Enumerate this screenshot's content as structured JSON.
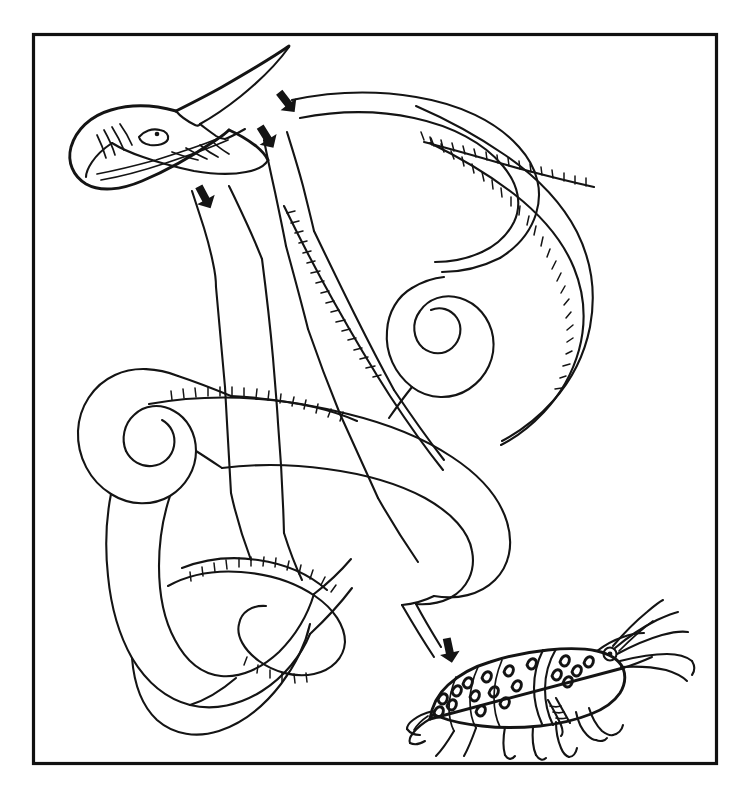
{
  "figure": {
    "title": "Squid capturing shrimp prey",
    "background_color": "#ffffff",
    "ink_color": "#141414",
    "frame_color": "#111111",
    "style": "black-and-white pen-and-ink line drawing",
    "frame": {
      "x": 32,
      "y": 33,
      "width": 686,
      "height": 732,
      "stroke_width": 3
    }
  },
  "subjects": {
    "squid": {
      "name": "squid",
      "parts": [
        "mantle-fin",
        "head",
        "eye",
        "gill-lines",
        "funnel",
        "arms",
        "feeding-tentacles",
        "sucker-rows"
      ],
      "position": "upper-left",
      "eye_center": [
        148,
        133
      ]
    },
    "shrimp": {
      "name": "shrimp",
      "parts": [
        "carapace",
        "abdomen-segments",
        "rostrum",
        "antennae",
        "eye",
        "walking-legs",
        "chelipeds",
        "tail-fan",
        "speckled-markings"
      ],
      "position": "lower-right",
      "eye_center": [
        610,
        654
      ]
    }
  },
  "annotations": {
    "arrow_count": 4,
    "arrow_direction": "down-right",
    "arrows": [
      {
        "id": "arrow-1",
        "x": 286,
        "y": 101,
        "rotation": 52
      },
      {
        "id": "arrow-2",
        "x": 266,
        "y": 136,
        "rotation": 58
      },
      {
        "id": "arrow-3",
        "x": 204,
        "y": 196,
        "rotation": 62
      },
      {
        "id": "arrow-4",
        "x": 449,
        "y": 649,
        "rotation": 78
      }
    ]
  },
  "elements": {
    "frame_label": "illustration-border",
    "squid_label": "squid",
    "shrimp_label": "shrimp",
    "arrow_label": "motion-arrow"
  }
}
